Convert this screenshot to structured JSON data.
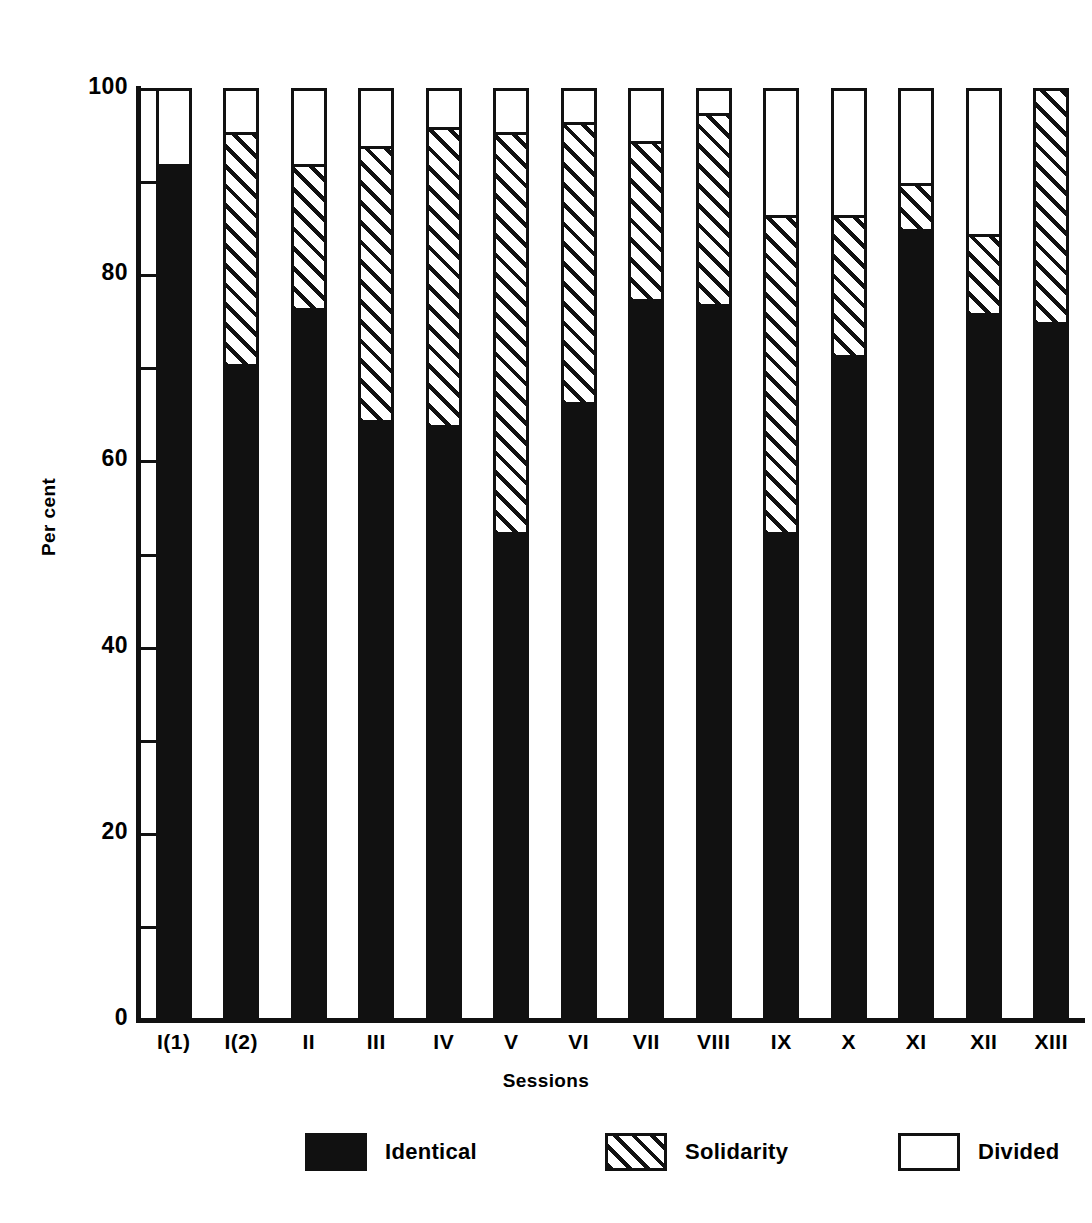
{
  "chart_data": {
    "type": "bar",
    "subtype": "stacked-bar-100-percent",
    "title": "",
    "xlabel": "Sessions",
    "ylabel": "Per cent",
    "ylim": [
      0,
      100
    ],
    "yticks_major": [
      0,
      20,
      40,
      60,
      80,
      100
    ],
    "yticks_minor": [
      10,
      30,
      50,
      70,
      90
    ],
    "ytick_labels": [
      "0",
      "20",
      "40",
      "60",
      "80",
      "100"
    ],
    "grid": false,
    "legend_position": "bottom",
    "categories": [
      "I(1)",
      "I(2)",
      "II",
      "III",
      "IV",
      "V",
      "VI",
      "VII",
      "VIII",
      "IX",
      "X",
      "XI",
      "XII",
      "XIII"
    ],
    "series": [
      {
        "name": "Identical",
        "fill": "solid-black",
        "color": "#111111",
        "values": [
          91.5,
          70.0,
          76.0,
          64.0,
          63.5,
          52.0,
          66.0,
          77.0,
          76.5,
          52.0,
          71.0,
          84.5,
          75.5,
          74.5
        ]
      },
      {
        "name": "Solidarity",
        "fill": "diagonal-hatch",
        "color": "#ffffff",
        "values": [
          0.0,
          25.0,
          15.5,
          29.5,
          32.0,
          43.0,
          30.0,
          17.0,
          20.5,
          34.0,
          15.0,
          5.0,
          8.5,
          25.5
        ]
      },
      {
        "name": "Divided",
        "fill": "white",
        "color": "#ffffff",
        "values": [
          8.5,
          5.0,
          8.5,
          6.5,
          4.5,
          5.0,
          4.0,
          6.0,
          3.0,
          14.0,
          14.0,
          10.5,
          16.0,
          0.0
        ]
      }
    ],
    "cumulative_tops": {
      "identical": [
        91.5,
        70.0,
        76.0,
        64.0,
        63.5,
        52.0,
        66.0,
        77.0,
        76.5,
        52.0,
        71.0,
        84.5,
        75.5,
        74.5
      ],
      "solidarity": [
        91.5,
        95.0,
        91.5,
        93.5,
        95.5,
        95.0,
        96.0,
        94.0,
        97.0,
        86.0,
        86.0,
        89.5,
        84.0,
        100.0
      ],
      "divided": [
        100,
        100,
        100,
        100,
        100,
        100,
        100,
        100,
        100,
        100,
        100,
        100,
        100,
        100
      ]
    }
  },
  "legend": {
    "items": [
      {
        "label": "Identical"
      },
      {
        "label": "Solidarity"
      },
      {
        "label": "Divided"
      }
    ]
  },
  "colors": {
    "ink": "#111111",
    "paper": "#ffffff"
  }
}
